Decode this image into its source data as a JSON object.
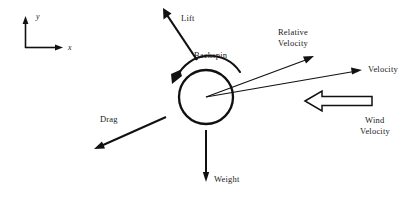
{
  "diagram": {
    "stroke_color": "#111111",
    "background_color": "#ffffff",
    "ball": {
      "name": "ball",
      "center_x": 206,
      "center_y": 97,
      "radius": 27
    },
    "axes": {
      "origin_x": 25,
      "origin_y": 48,
      "y_label": "y",
      "x_label": "x",
      "y_tip_y": 17,
      "x_tip_x": 63
    },
    "labels": {
      "lift": "Lift",
      "backspin": "Backspin",
      "relative_velocity_line1": "Relative",
      "relative_velocity_line2": "Velocity",
      "velocity": "Velocity",
      "wind_velocity_line1": "Wind",
      "wind_velocity_line2": "Velocity",
      "drag": "Drag",
      "weight": "Weight"
    },
    "vectors": [
      {
        "name": "lift",
        "label": "Lift",
        "x1": 197,
        "y1": 60,
        "x2": 163,
        "y2": 9,
        "direction": "up-left",
        "style": "solid-arrow"
      },
      {
        "name": "relative-velocity",
        "label": "Relative Velocity",
        "x1": 206,
        "y1": 97,
        "x2": 313,
        "y2": 57,
        "direction": "up-right",
        "style": "solid-arrow"
      },
      {
        "name": "velocity",
        "label": "Velocity",
        "x1": 206,
        "y1": 97,
        "x2": 360,
        "y2": 70,
        "direction": "right-slightly-up",
        "style": "solid-arrow"
      },
      {
        "name": "drag",
        "label": "Drag",
        "x1": 166,
        "y1": 117,
        "x2": 96,
        "y2": 148,
        "direction": "down-left",
        "style": "solid-arrow"
      },
      {
        "name": "weight",
        "label": "Weight",
        "x1": 206,
        "y1": 130,
        "x2": 206,
        "y2": 181,
        "direction": "down",
        "style": "solid-arrow"
      },
      {
        "name": "wind-velocity",
        "label": "Wind Velocity",
        "x1": 372,
        "y1": 101,
        "x2": 305,
        "y2": 101,
        "direction": "left",
        "style": "hollow-block-arrow"
      },
      {
        "name": "backspin",
        "label": "Backspin",
        "direction": "counter-clockwise",
        "style": "curved-arc-arrow"
      }
    ]
  }
}
